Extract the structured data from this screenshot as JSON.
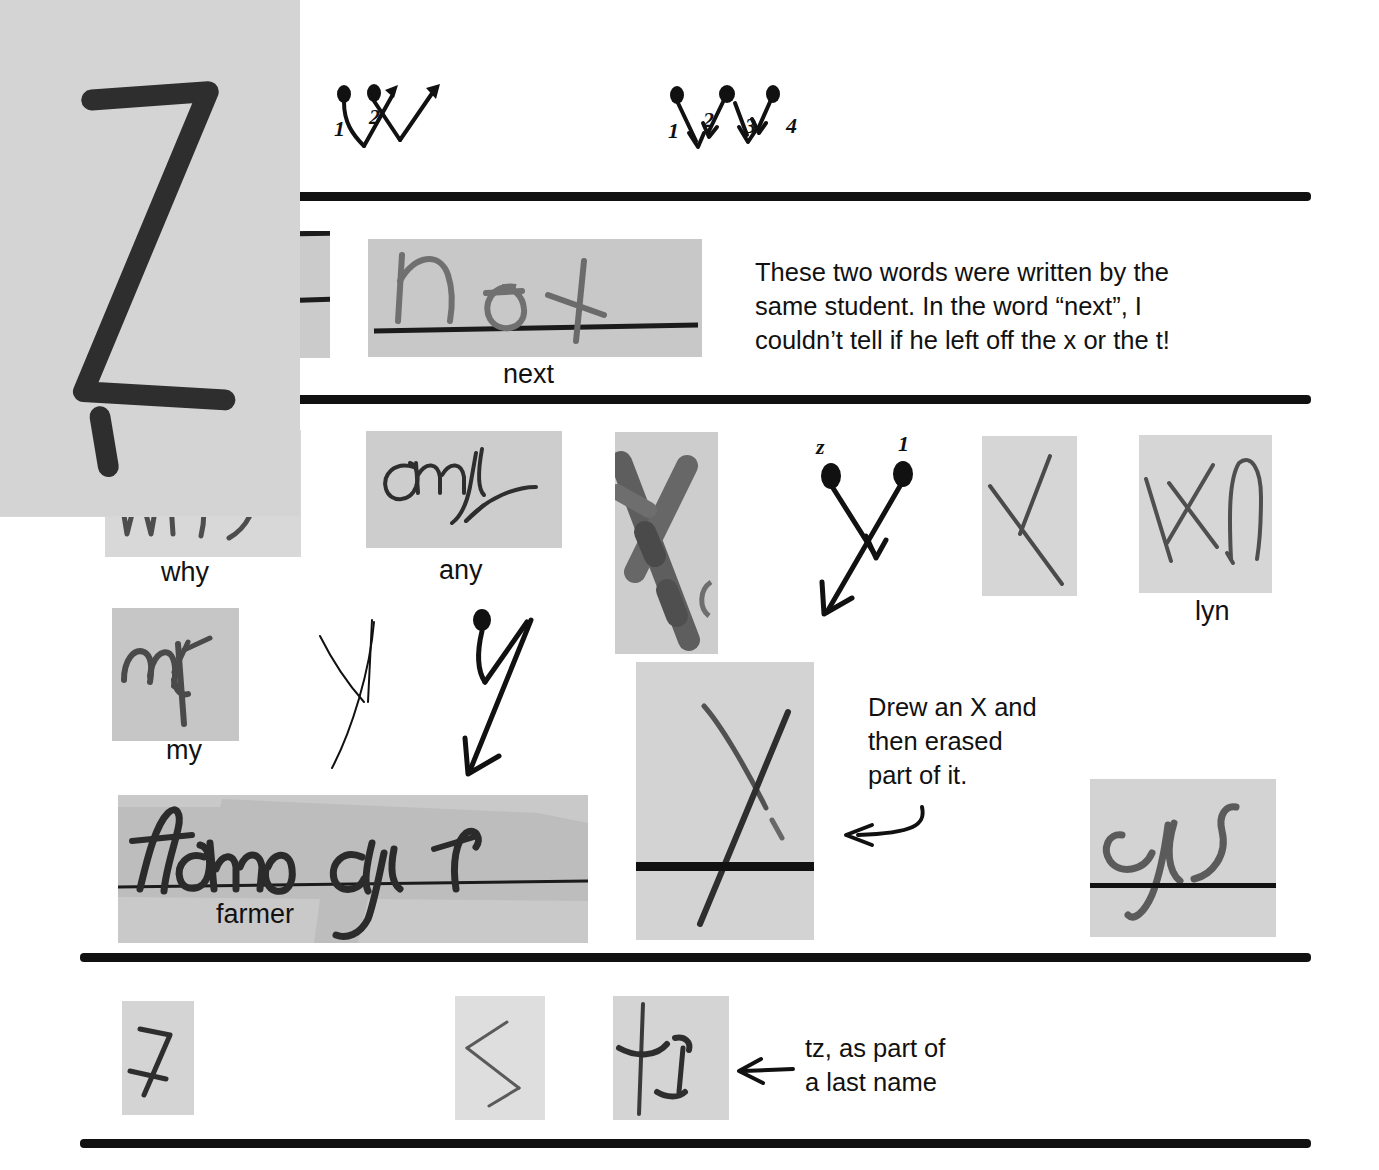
{
  "page": {
    "background_color": "#ffffff",
    "ink_color": "#111111",
    "scan_paper_color": "#c9c9c9",
    "width": 1379,
    "height": 1170
  },
  "sections": [
    {
      "id": "section-w",
      "letter": "W",
      "items": [
        {
          "type": "scan",
          "label": "",
          "alt": "handwritten W between two ruled lines"
        },
        {
          "type": "stroke-diagram",
          "alt": "two-stroke W stroke order diagram",
          "stroke_numbers": [
            "1",
            "2"
          ]
        },
        {
          "type": "stroke-diagram",
          "alt": "four-stroke W stroke order diagram",
          "stroke_numbers": [
            "1",
            "2",
            "3",
            "4"
          ]
        }
      ]
    },
    {
      "id": "section-x-words",
      "letter": "x",
      "items": [
        {
          "type": "scan",
          "label": "box",
          "alt": "handwritten word box on ruled paper"
        },
        {
          "type": "scan",
          "label": "next",
          "alt": "handwritten word next on ruled paper"
        }
      ],
      "note": {
        "lines": [
          "These two words were written by the",
          "same student. In the word “next”, I",
          "couldn’t tell if he left off the x or the t!"
        ]
      }
    },
    {
      "id": "section-y",
      "letter": "y",
      "items": [
        {
          "type": "scan",
          "label": "why",
          "alt": "handwritten word why"
        },
        {
          "type": "scan",
          "label": "any",
          "alt": "handwritten word any in cursive"
        },
        {
          "type": "scan",
          "label": "",
          "alt": "thick marker Y"
        },
        {
          "type": "stroke-diagram",
          "alt": "two-stroke Y stroke order diagram",
          "stroke_numbers": [
            "z",
            "1"
          ]
        },
        {
          "type": "scan",
          "label": "",
          "alt": "handwritten Y, single long stroke"
        },
        {
          "type": "scan",
          "label": "lyn",
          "alt": "handwritten letters lyn"
        },
        {
          "type": "scan",
          "label": "my",
          "alt": "handwritten word my"
        },
        {
          "type": "ink",
          "label": "",
          "alt": "thin outline Y letterform"
        },
        {
          "type": "ink",
          "label": "",
          "alt": "Y stroke-order arrow diagram"
        },
        {
          "type": "scan",
          "label": "farmer",
          "alt": "handwritten word farmer highlighted on ruled line"
        },
        {
          "type": "scan",
          "label": "",
          "alt": "handwritten X with part erased, crossing a ruled line"
        },
        {
          "type": "scan",
          "label": "",
          "alt": "handwritten cursive y crossing a ruled line"
        }
      ],
      "note": {
        "lines": [
          "Drew an X and",
          "then erased",
          "part of it."
        ]
      }
    },
    {
      "id": "section-z",
      "letter": "z",
      "items": [
        {
          "type": "scan",
          "label": "",
          "alt": "handwritten Z variant 1"
        },
        {
          "type": "scan",
          "label": "",
          "alt": "handwritten Z variant 2"
        },
        {
          "type": "scan",
          "label": "",
          "alt": "handwritten Z drawn as a sideways angle"
        },
        {
          "type": "scan",
          "label": "",
          "alt": "handwritten t z letters"
        }
      ],
      "note": {
        "lines": [
          "tz, as part of",
          "a last name"
        ]
      }
    }
  ]
}
